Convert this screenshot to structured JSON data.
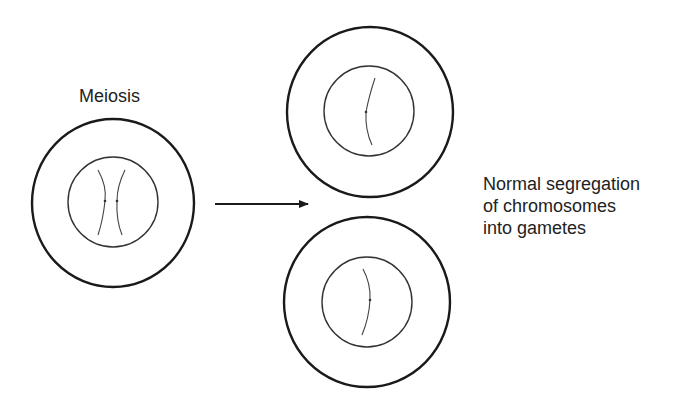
{
  "title_label": "Meiosis",
  "outcome_label": {
    "lines": [
      "Normal segregation",
      "of chromosomes",
      "into gametes"
    ]
  },
  "colors": {
    "stroke": "#1a1a1a",
    "chromosome": "#333333",
    "background": "#ffffff"
  },
  "cells": [
    {
      "id": "parent-cell",
      "chromosome_count": 2,
      "role": "meiosis input"
    },
    {
      "id": "gamete-top",
      "chromosome_count": 1,
      "role": "gamete"
    },
    {
      "id": "gamete-bottom",
      "chromosome_count": 1,
      "role": "gamete"
    }
  ],
  "arrow": {
    "direction": "right"
  }
}
